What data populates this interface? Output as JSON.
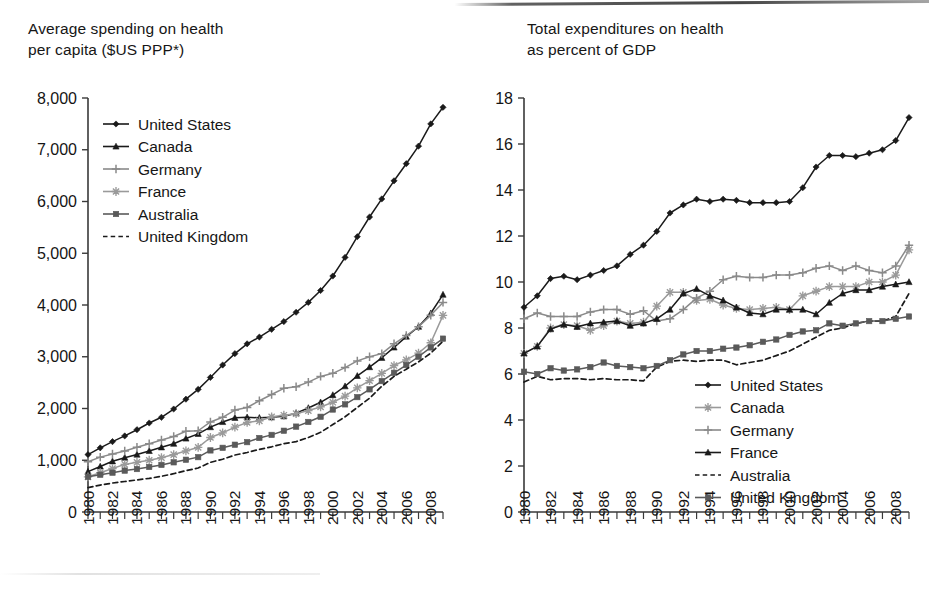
{
  "page": {
    "figure_kind": "two-panel line chart (scanned book page)"
  },
  "left": {
    "title": "Average spending on health\nper capita ($US PPP*)",
    "legend": [
      {
        "label": "United States",
        "marker": "diamond",
        "color": "#1a1a1a",
        "dash": "none"
      },
      {
        "label": "Canada",
        "marker": "triangle",
        "color": "#1a1a1a",
        "dash": "none"
      },
      {
        "label": "Germany",
        "marker": "plus",
        "color": "#8a8a8a",
        "dash": "none"
      },
      {
        "label": "France",
        "marker": "star",
        "color": "#9a9a9a",
        "dash": "none"
      },
      {
        "label": "Australia",
        "marker": "square",
        "color": "#5a5a5a",
        "dash": "none"
      },
      {
        "label": "United Kingdom",
        "marker": "none",
        "color": "#1a1a1a",
        "dash": "dashed"
      }
    ]
  },
  "right": {
    "title": "Total expenditures on health\nas percent of GDP",
    "legend": [
      {
        "label": "United States",
        "marker": "diamond",
        "color": "#1a1a1a",
        "dash": "none"
      },
      {
        "label": "Canada",
        "marker": "star",
        "color": "#9a9a9a",
        "dash": "none"
      },
      {
        "label": "Germany",
        "marker": "plus",
        "color": "#8a8a8a",
        "dash": "none"
      },
      {
        "label": "France",
        "marker": "triangle",
        "color": "#1a1a1a",
        "dash": "none"
      },
      {
        "label": "Australia",
        "marker": "none",
        "color": "#1a1a1a",
        "dash": "dashed"
      },
      {
        "label": "United Kingdom",
        "marker": "square",
        "color": "#5a5a5a",
        "dash": "none"
      }
    ]
  },
  "chart_data": [
    {
      "type": "line",
      "panel": "left",
      "title": "Average spending on health per capita ($US PPP*)",
      "xlabel": "",
      "ylabel": "Average spending on health per capita ($US PPP*)",
      "ylim": [
        0,
        8000
      ],
      "yticks": [
        0,
        1000,
        2000,
        3000,
        4000,
        5000,
        6000,
        7000,
        8000
      ],
      "ytick_labels": [
        "0",
        "1,000",
        "2,000",
        "3,000",
        "4,000",
        "5,000",
        "6,000",
        "7,000",
        "8,000"
      ],
      "xlim": [
        1980,
        2009
      ],
      "x": [
        1980,
        1981,
        1982,
        1983,
        1984,
        1985,
        1986,
        1987,
        1988,
        1989,
        1990,
        1991,
        1992,
        1993,
        1994,
        1995,
        1996,
        1997,
        1998,
        1999,
        2000,
        2001,
        2002,
        2003,
        2004,
        2005,
        2006,
        2007,
        2008,
        2009
      ],
      "xtick_labels": [
        "1980",
        "1982",
        "1984",
        "1986",
        "1988",
        "1990",
        "1992",
        "1994",
        "1996",
        "1998",
        "2000",
        "2002",
        "2004",
        "2006",
        "2008"
      ],
      "xtick_values": [
        1980,
        1982,
        1984,
        1986,
        1988,
        1990,
        1992,
        1994,
        1996,
        1998,
        2000,
        2002,
        2004,
        2006,
        2008
      ],
      "minor_ticks": "every year",
      "grid": false,
      "legend_position": "upper-left inside",
      "series": [
        {
          "name": "United States",
          "values": [
            1110,
            1240,
            1360,
            1470,
            1590,
            1720,
            1830,
            1990,
            2180,
            2370,
            2600,
            2840,
            3060,
            3250,
            3380,
            3530,
            3680,
            3860,
            4050,
            4280,
            4560,
            4920,
            5320,
            5700,
            6050,
            6400,
            6730,
            7070,
            7500,
            7820
          ]
        },
        {
          "name": "Canada",
          "values": [
            780,
            880,
            980,
            1050,
            1110,
            1180,
            1250,
            1320,
            1420,
            1510,
            1640,
            1740,
            1820,
            1830,
            1820,
            1830,
            1850,
            1910,
            2010,
            2120,
            2260,
            2430,
            2630,
            2800,
            2980,
            3180,
            3390,
            3580,
            3840,
            4200
          ]
        },
        {
          "name": "Germany",
          "values": [
            970,
            1060,
            1120,
            1180,
            1250,
            1320,
            1390,
            1460,
            1560,
            1570,
            1740,
            1830,
            1970,
            2020,
            2150,
            2270,
            2390,
            2420,
            2510,
            2620,
            2680,
            2790,
            2920,
            3000,
            3060,
            3250,
            3410,
            3580,
            3800,
            4050
          ]
        },
        {
          "name": "France",
          "values": [
            680,
            760,
            840,
            920,
            960,
            1000,
            1050,
            1110,
            1180,
            1250,
            1440,
            1530,
            1640,
            1730,
            1760,
            1840,
            1870,
            1900,
            1960,
            2030,
            2120,
            2240,
            2400,
            2540,
            2680,
            2830,
            2940,
            3070,
            3270,
            3800
          ]
        },
        {
          "name": "Australia",
          "values": [
            680,
            720,
            760,
            800,
            830,
            870,
            910,
            960,
            1010,
            1060,
            1190,
            1240,
            1300,
            1350,
            1430,
            1490,
            1570,
            1650,
            1740,
            1840,
            1980,
            2080,
            2220,
            2370,
            2530,
            2690,
            2840,
            3000,
            3180,
            3350
          ]
        },
        {
          "name": "United Kingdom",
          "values": [
            470,
            520,
            560,
            590,
            620,
            650,
            690,
            740,
            800,
            850,
            960,
            1020,
            1100,
            1150,
            1210,
            1260,
            1320,
            1360,
            1440,
            1540,
            1690,
            1840,
            2020,
            2200,
            2430,
            2620,
            2760,
            2900,
            3070,
            3300
          ]
        }
      ]
    },
    {
      "type": "line",
      "panel": "right",
      "title": "Total expenditures on health as percent of GDP",
      "xlabel": "",
      "ylabel": "Total expenditures on health as percent of GDP",
      "ylim": [
        0,
        18
      ],
      "yticks": [
        0,
        2,
        4,
        6,
        8,
        10,
        12,
        14,
        16,
        18
      ],
      "ytick_labels": [
        "0",
        "2",
        "4",
        "6",
        "8",
        "10",
        "12",
        "14",
        "16",
        "18"
      ],
      "xlim": [
        1980,
        2009
      ],
      "x": [
        1980,
        1981,
        1982,
        1983,
        1984,
        1985,
        1986,
        1987,
        1988,
        1989,
        1990,
        1991,
        1992,
        1993,
        1994,
        1995,
        1996,
        1997,
        1998,
        1999,
        2000,
        2001,
        2002,
        2003,
        2004,
        2005,
        2006,
        2007,
        2008,
        2009
      ],
      "xtick_labels": [
        "1980",
        "1982",
        "1984",
        "1986",
        "1988",
        "1990",
        "1992",
        "1994",
        "1996",
        "1998",
        "2000",
        "2002",
        "2004",
        "2006",
        "2008"
      ],
      "xtick_values": [
        1980,
        1982,
        1984,
        1986,
        1988,
        1990,
        1992,
        1994,
        1996,
        1998,
        2000,
        2002,
        2004,
        2006,
        2008
      ],
      "minor_ticks": "every year",
      "grid": false,
      "legend_position": "lower-right inside",
      "series": [
        {
          "name": "United States",
          "values": [
            8.9,
            9.4,
            10.15,
            10.25,
            10.1,
            10.3,
            10.5,
            10.7,
            11.2,
            11.6,
            12.2,
            13.0,
            13.35,
            13.6,
            13.5,
            13.6,
            13.55,
            13.45,
            13.45,
            13.45,
            13.5,
            14.1,
            15.0,
            15.5,
            15.5,
            15.45,
            15.6,
            15.75,
            16.15,
            17.15
          ]
        },
        {
          "name": "Canada",
          "values": [
            6.9,
            7.2,
            8.0,
            8.15,
            8.1,
            7.9,
            8.1,
            8.3,
            8.2,
            8.25,
            8.95,
            9.55,
            9.55,
            9.2,
            9.25,
            9.0,
            8.85,
            8.8,
            8.85,
            8.9,
            8.8,
            9.4,
            9.6,
            9.8,
            9.8,
            9.8,
            10.0,
            10.0,
            10.3,
            11.4
          ]
        },
        {
          "name": "Germany",
          "values": [
            8.4,
            8.65,
            8.5,
            8.5,
            8.5,
            8.7,
            8.8,
            8.8,
            8.6,
            8.75,
            8.3,
            8.4,
            8.8,
            9.3,
            9.6,
            10.1,
            10.25,
            10.2,
            10.2,
            10.3,
            10.3,
            10.4,
            10.6,
            10.7,
            10.5,
            10.7,
            10.5,
            10.4,
            10.7,
            11.6
          ]
        },
        {
          "name": "France",
          "values": [
            6.9,
            7.2,
            7.95,
            8.15,
            8.05,
            8.2,
            8.25,
            8.3,
            8.1,
            8.2,
            8.4,
            8.8,
            9.5,
            9.7,
            9.4,
            9.2,
            8.9,
            8.65,
            8.6,
            8.8,
            8.8,
            8.8,
            8.6,
            9.1,
            9.5,
            9.65,
            9.65,
            9.8,
            9.9,
            10.0,
            11.15
          ]
        },
        {
          "name": "Australia",
          "values": [
            5.65,
            5.9,
            5.75,
            5.8,
            5.8,
            5.75,
            5.8,
            5.75,
            5.75,
            5.7,
            6.3,
            6.55,
            6.6,
            6.55,
            6.6,
            6.6,
            6.4,
            6.5,
            6.6,
            6.8,
            7.0,
            7.3,
            7.6,
            7.9,
            8.0,
            8.2,
            8.3,
            8.3,
            8.5,
            9.5
          ]
        },
        {
          "name": "United Kingdom",
          "values": [
            6.1,
            6.0,
            6.25,
            6.15,
            6.2,
            6.3,
            6.5,
            6.35,
            6.3,
            6.25,
            6.35,
            6.6,
            6.85,
            7.0,
            7.0,
            7.1,
            7.15,
            7.25,
            7.4,
            7.5,
            7.7,
            7.85,
            7.9,
            8.2,
            8.1,
            8.2,
            8.3,
            8.3,
            8.4,
            8.5
          ]
        }
      ]
    }
  ]
}
